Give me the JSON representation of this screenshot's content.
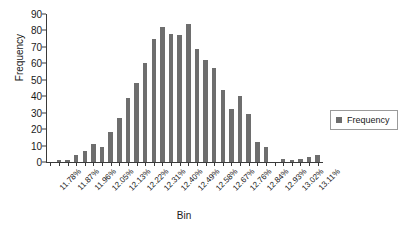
{
  "chart_data": {
    "type": "bar",
    "title": "",
    "xlabel": "Bin",
    "ylabel": "Frequency",
    "ylim": [
      0,
      90
    ],
    "yticks": [
      0,
      10,
      20,
      30,
      40,
      50,
      60,
      70,
      80,
      90
    ],
    "grid": false,
    "legend": {
      "position": "right",
      "entries": [
        "Frequency"
      ]
    },
    "tick_label_rotation": -45,
    "note": "Histogram of bin percentages; every other bin is labeled on the x-axis",
    "categories": [
      "11.78%",
      "",
      "11.87%",
      "",
      "11.96%",
      "",
      "12.05%",
      "",
      "12.13%",
      "",
      "12.22%",
      "",
      "12.31%",
      "",
      "12.40%",
      "",
      "12.49%",
      "",
      "12.58%",
      "",
      "12.67%",
      "",
      "12.76%",
      "",
      "12.84%",
      "",
      "12.93%",
      "",
      "13.02%",
      "",
      "13.11%",
      ""
    ],
    "labeled_categories": [
      "11.78%",
      "11.87%",
      "11.96%",
      "12.05%",
      "12.13%",
      "12.22%",
      "12.31%",
      "12.40%",
      "12.49%",
      "12.58%",
      "12.67%",
      "12.76%",
      "12.84%",
      "12.93%",
      "13.02%",
      "13.11%"
    ],
    "values": [
      0,
      1,
      1,
      4,
      7,
      11,
      9,
      18,
      27,
      39,
      48,
      60,
      75,
      82,
      78,
      77,
      84,
      69,
      62,
      57,
      44,
      32,
      40,
      29,
      12,
      9,
      0,
      2,
      1,
      2,
      3,
      4
    ],
    "series": [
      {
        "name": "Frequency",
        "color": "#6e6e6e",
        "values": [
          0,
          1,
          1,
          4,
          7,
          11,
          9,
          18,
          27,
          39,
          48,
          60,
          75,
          82,
          78,
          77,
          84,
          69,
          62,
          57,
          44,
          32,
          40,
          29,
          12,
          9,
          0,
          2,
          1,
          2,
          3,
          4
        ]
      }
    ]
  },
  "colors": {
    "bar": "#6e6e6e",
    "axis": "#3a3a3a",
    "background": "#ffffff",
    "legend_border": "#9a9a9a"
  }
}
